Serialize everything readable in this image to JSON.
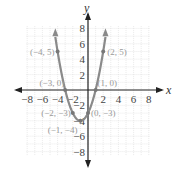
{
  "chart_data": {
    "type": "line",
    "title": "",
    "xlabel": "x",
    "ylabel": "y",
    "xlim": [
      -8,
      8
    ],
    "ylim": [
      -8,
      8
    ],
    "grid": true,
    "x_ticks": [
      "−8",
      "−6",
      "−4",
      "−2",
      "2",
      "4",
      "6",
      "8"
    ],
    "y_ticks": [
      "8",
      "6",
      "4",
      "2",
      "−2",
      "−4",
      "−6",
      "−8"
    ],
    "series": [
      {
        "name": "parabola",
        "equation": "y = x^2 + 2x - 3",
        "color": "#888888",
        "x": [
          -4.2,
          -4,
          -3,
          -2,
          -1,
          0,
          1,
          2,
          2.2
        ],
        "y": [
          6.24,
          5,
          0,
          -3,
          -4,
          -3,
          0,
          5,
          6.24
        ]
      }
    ],
    "points": [
      {
        "label": "(−4, 5)",
        "x": -4,
        "y": 5
      },
      {
        "label": "(2, 5)",
        "x": 2,
        "y": 5
      },
      {
        "label": "(−3, 0)",
        "x": -3,
        "y": 0
      },
      {
        "label": "(1, 0)",
        "x": 1,
        "y": 0
      },
      {
        "label": "(−2, −3)",
        "x": -2,
        "y": -3
      },
      {
        "label": "(0, −3)",
        "x": 0,
        "y": -3
      },
      {
        "label": "(−1, −4)",
        "x": -1,
        "y": -4
      }
    ]
  }
}
